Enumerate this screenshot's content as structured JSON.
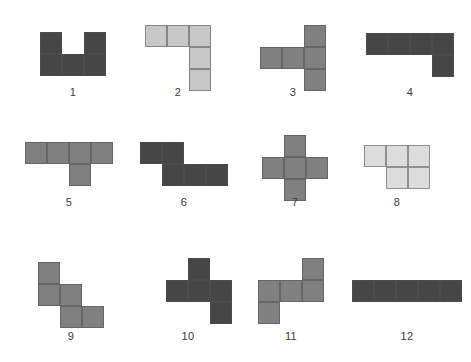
{
  "page": {
    "background_color": "#ffffff",
    "width": 471,
    "height": 362,
    "cell_size": 22,
    "cell_border_color": "#505050"
  },
  "palette": {
    "dark_gray": "#464646",
    "mid_gray": "#808080",
    "light_gray": "#c8c8c8",
    "very_light_gray": "#dcdcdc"
  },
  "shapes": [
    {
      "label": "1",
      "name": "shape-u-pentomino",
      "color": "#464646",
      "origin_x": 40,
      "origin_y": 32,
      "label_x": 40,
      "label_y": 86,
      "label_width": 66,
      "cells": [
        [
          0,
          0
        ],
        [
          2,
          0
        ],
        [
          0,
          1
        ],
        [
          1,
          1
        ],
        [
          2,
          1
        ]
      ]
    },
    {
      "label": "2",
      "name": "shape-l-pentomino",
      "color": "#c8c8c8",
      "origin_x": 145,
      "origin_y": 25,
      "label_x": 145,
      "label_y": 86,
      "label_width": 66,
      "cells": [
        [
          0,
          0
        ],
        [
          1,
          0
        ],
        [
          2,
          0
        ],
        [
          2,
          1
        ],
        [
          2,
          2
        ]
      ]
    },
    {
      "label": "3",
      "name": "shape-t-rotated-pentomino",
      "color": "#808080",
      "origin_x": 260,
      "origin_y": 25,
      "label_x": 260,
      "label_y": 86,
      "label_width": 66,
      "cells": [
        [
          2,
          0
        ],
        [
          0,
          1
        ],
        [
          1,
          1
        ],
        [
          2,
          1
        ],
        [
          2,
          2
        ]
      ]
    },
    {
      "label": "4",
      "name": "shape-j-pentomino",
      "color": "#464646",
      "origin_x": 366,
      "origin_y": 33,
      "label_x": 366,
      "label_y": 86,
      "label_width": 88,
      "cells": [
        [
          0,
          0
        ],
        [
          1,
          0
        ],
        [
          2,
          0
        ],
        [
          3,
          0
        ],
        [
          3,
          1
        ]
      ]
    },
    {
      "label": "5",
      "name": "shape-y-pentomino",
      "color": "#808080",
      "origin_x": 25,
      "origin_y": 142,
      "label_x": 25,
      "label_y": 196,
      "label_width": 88,
      "cells": [
        [
          0,
          0
        ],
        [
          1,
          0
        ],
        [
          2,
          0
        ],
        [
          3,
          0
        ],
        [
          2,
          1
        ]
      ]
    },
    {
      "label": "6",
      "name": "shape-n-pentomino",
      "color": "#464646",
      "origin_x": 140,
      "origin_y": 142,
      "label_x": 140,
      "label_y": 196,
      "label_width": 88,
      "cells": [
        [
          0,
          0
        ],
        [
          1,
          0
        ],
        [
          1,
          1
        ],
        [
          2,
          1
        ],
        [
          3,
          1
        ]
      ]
    },
    {
      "label": "7",
      "name": "shape-plus-pentomino",
      "color": "#808080",
      "origin_x": 262,
      "origin_y": 135,
      "label_x": 262,
      "label_y": 196,
      "label_width": 66,
      "cells": [
        [
          1,
          0
        ],
        [
          0,
          1
        ],
        [
          1,
          1
        ],
        [
          2,
          1
        ],
        [
          1,
          2
        ]
      ]
    },
    {
      "label": "8",
      "name": "shape-p-pentomino",
      "color": "#dcdcdc",
      "origin_x": 364,
      "origin_y": 145,
      "label_x": 364,
      "label_y": 196,
      "label_width": 66,
      "cells": [
        [
          0,
          0
        ],
        [
          1,
          0
        ],
        [
          2,
          0
        ],
        [
          1,
          1
        ],
        [
          2,
          1
        ]
      ]
    },
    {
      "label": "9",
      "name": "shape-w-pentomino",
      "color": "#808080",
      "origin_x": 38,
      "origin_y": 262,
      "label_x": 38,
      "label_y": 330,
      "label_width": 66,
      "cells": [
        [
          0,
          0
        ],
        [
          0,
          1
        ],
        [
          1,
          1
        ],
        [
          1,
          2
        ],
        [
          2,
          2
        ]
      ]
    },
    {
      "label": "10",
      "name": "shape-s-pentomino",
      "color": "#464646",
      "origin_x": 166,
      "origin_y": 258,
      "label_x": 155,
      "label_y": 330,
      "label_width": 66,
      "cells": [
        [
          1,
          0
        ],
        [
          0,
          1
        ],
        [
          1,
          1
        ],
        [
          2,
          1
        ],
        [
          2,
          2
        ]
      ]
    },
    {
      "label": "11",
      "name": "shape-z-pentomino",
      "color": "#808080",
      "origin_x": 258,
      "origin_y": 258,
      "label_x": 258,
      "label_y": 330,
      "label_width": 66,
      "cells": [
        [
          2,
          0
        ],
        [
          0,
          1
        ],
        [
          1,
          1
        ],
        [
          2,
          1
        ],
        [
          0,
          2
        ]
      ]
    },
    {
      "label": "12",
      "name": "shape-i-pentomino",
      "color": "#464646",
      "origin_x": 352,
      "origin_y": 280,
      "label_x": 352,
      "label_y": 330,
      "label_width": 110,
      "cells": [
        [
          0,
          0
        ],
        [
          1,
          0
        ],
        [
          2,
          0
        ],
        [
          3,
          0
        ],
        [
          4,
          0
        ]
      ]
    }
  ]
}
